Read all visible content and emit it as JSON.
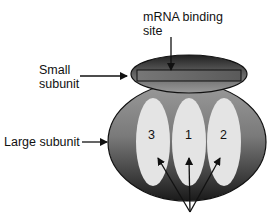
{
  "diagram": {
    "labels": {
      "mrna_site": [
        "mRNA binding",
        "site"
      ],
      "small_subunit": [
        "Small",
        "subunit"
      ],
      "large_subunit": "Large subunit"
    },
    "sites": [
      {
        "number": "3"
      },
      {
        "number": "1"
      },
      {
        "number": "2"
      }
    ],
    "colors": {
      "subunit_dark": "#1e1e1e",
      "subunit_mid": "#8a8a8a",
      "site_fill": "#e4e4e4",
      "binding_bar": "#6e6e6e"
    }
  }
}
